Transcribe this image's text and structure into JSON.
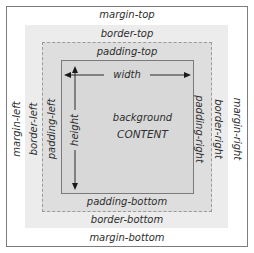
{
  "diagram": {
    "labels": {
      "margin_top": "margin-top",
      "margin_bottom": "margin-bottom",
      "margin_left": "margin-left",
      "margin_right": "margin-right",
      "border_top": "border-top",
      "border_bottom": "border-bottom",
      "border_left": "border-left",
      "border_right": "border-right",
      "padding_top": "padding-top",
      "padding_bottom": "padding-bottom",
      "padding_left": "padding-left",
      "padding_right": "padding-right",
      "width": "width",
      "height": "height",
      "background": "background",
      "content": "CONTENT"
    },
    "colors": {
      "margin": "#ffffff",
      "border": "#ececec",
      "padding": "#dedede",
      "content": "#d8d8d8",
      "frame_line": "#7d7d7d",
      "text": "#2e2e2e"
    }
  }
}
